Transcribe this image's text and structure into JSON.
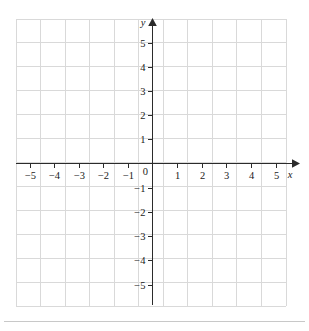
{
  "figure": {
    "kind": "cartesian-coordinate-plane",
    "background_color": "#ffffff",
    "grid_color": "#d9d9d9",
    "axis_color": "#2b2b2b",
    "label_color": "#1a1a1a",
    "axis_labels": {
      "x": "x",
      "y": "y"
    },
    "origin_label": "0"
  },
  "chart_data": {
    "type": "scatter",
    "title": "",
    "xlabel": "x",
    "ylabel": "y",
    "xlim": [
      -5.6,
      5.45
    ],
    "ylim": [
      -5.9,
      6.05
    ],
    "grid": true,
    "legend": null,
    "series": [],
    "x_tick_labels": [
      "−5",
      "−4",
      "−3",
      "−2",
      "−1",
      "0",
      "1",
      "2",
      "3",
      "4",
      "5"
    ],
    "x_tick_values": [
      -5,
      -4,
      -3,
      -2,
      -1,
      0,
      1,
      2,
      3,
      4,
      5
    ],
    "y_tick_labels": [
      "5",
      "4",
      "3",
      "2",
      "1",
      "−1",
      "−2",
      "−3",
      "−4",
      "−5"
    ],
    "y_tick_values": [
      5,
      4,
      3,
      2,
      1,
      -1,
      -2,
      -3,
      -4,
      -5
    ],
    "annotations": []
  },
  "axes": {
    "x_ticks": [
      {
        "value": -5,
        "label": "−5"
      },
      {
        "value": -4,
        "label": "−4"
      },
      {
        "value": -3,
        "label": "−3"
      },
      {
        "value": -2,
        "label": "−2"
      },
      {
        "value": -1,
        "label": "−1"
      },
      {
        "value": 1,
        "label": "1"
      },
      {
        "value": 2,
        "label": "2"
      },
      {
        "value": 3,
        "label": "3"
      },
      {
        "value": 4,
        "label": "4"
      },
      {
        "value": 5,
        "label": "5"
      }
    ],
    "y_ticks": [
      {
        "value": 5,
        "label": "5"
      },
      {
        "value": 4,
        "label": "4"
      },
      {
        "value": 3,
        "label": "3"
      },
      {
        "value": 2,
        "label": "2"
      },
      {
        "value": 1,
        "label": "1"
      },
      {
        "value": -1,
        "label": "−1"
      },
      {
        "value": -2,
        "label": "−2"
      },
      {
        "value": -3,
        "label": "−3"
      },
      {
        "value": -4,
        "label": "−4"
      },
      {
        "value": -5,
        "label": "−5"
      }
    ]
  }
}
